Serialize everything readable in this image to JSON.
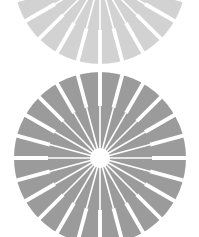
{
  "canvas": {
    "width": 199,
    "height": 237,
    "background": "#ffffff"
  },
  "wheels": [
    {
      "name": "top-wheel",
      "cx": 100,
      "cy": -22,
      "r": 86,
      "fill": "#d2d2d2",
      "spokes": 24,
      "slot_inner_r": 52,
      "slot_width_deg": 4.2,
      "line_width": 1.6,
      "hub_r": 8
    },
    {
      "name": "bottom-wheel",
      "cx": 100,
      "cy": 158,
      "r": 86,
      "fill": "#9b9b9b",
      "spokes": 24,
      "slot_inner_r": 52,
      "slot_width_deg": 4.2,
      "line_width": 1.6,
      "hub_r": 10
    }
  ],
  "spoke_color": "#ffffff"
}
